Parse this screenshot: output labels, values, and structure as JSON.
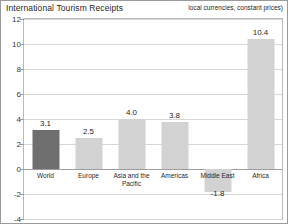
{
  "header": {
    "title": "International Tourism Receipts",
    "subtitle": "local currencies, constant prices)"
  },
  "chart_data": {
    "type": "bar",
    "title": "International Tourism Receipts",
    "subtitle": "local currencies, constant prices)",
    "categories": [
      "World",
      "Europe",
      "Asia and the\nPacific",
      "Americas",
      "Middle East",
      "Africa"
    ],
    "values": [
      3.1,
      2.5,
      4.0,
      3.8,
      -1.8,
      10.4
    ],
    "value_labels": [
      "3.1",
      "2.5",
      "4.0",
      "3.8",
      "-1.8",
      "10.4"
    ],
    "series": [
      {
        "name": "International Tourism Receipts",
        "values": [
          3.1,
          2.5,
          4.0,
          3.8,
          -1.8,
          10.4
        ]
      }
    ],
    "xlabel": "",
    "ylabel": "",
    "ylim": [
      -4,
      12
    ],
    "yticks": [
      12,
      10,
      8,
      6,
      4,
      2,
      0,
      -2,
      -4
    ],
    "ytick_labels": [
      "12",
      "10",
      "8",
      "6",
      "4",
      "2",
      "0",
      "-2",
      "-4"
    ],
    "grid": true,
    "legend": false,
    "colors": {
      "highlight_bar": "#6e6e6e",
      "default_bar": "#d2d2d2",
      "gridline": "#d6d6d6",
      "zero_line": "#9d9d9d",
      "frame": "#b9b9b9",
      "outer_border": "#9a9a9a",
      "text": "#1f1f1f"
    },
    "highlight_index": 0
  }
}
